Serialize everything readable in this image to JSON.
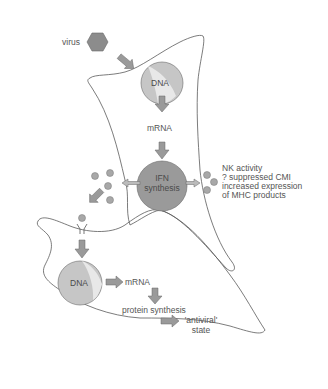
{
  "diagram": {
    "colors": {
      "cell_outline": "#5a5a5a",
      "virus_fill": "#8c8c8c",
      "dna_fill": "#c6c6c6",
      "dna_highlight": "#e6e6e6",
      "ifn_fill": "#9a9a9a",
      "arrow_fill": "#9a9a9a",
      "dot_fill": "#a8a8a8",
      "text": "#555555"
    },
    "labels": {
      "virus": "virus",
      "dna_upper": "DNA",
      "mrna_upper": "mRNA",
      "ifn_line1": "IFN",
      "ifn_line2": "synthesis",
      "effects": "NK activity\n? suppressed CMI\nincreased expression\nof MHC products",
      "dna_lower": "DNA",
      "mrna_lower": "mRNA",
      "protein_synthesis": "protein synthesis",
      "antiviral_state": "'antiviral'\nstate"
    },
    "nodes": [
      {
        "id": "virus",
        "shape": "hexagon",
        "label": "virus"
      },
      {
        "id": "infected-cell",
        "shape": "cell",
        "contains": [
          "DNA",
          "mRNA",
          "IFN synthesis"
        ]
      },
      {
        "id": "ifn-molecules",
        "shape": "dots",
        "count": 7
      },
      {
        "id": "receptor",
        "shape": "receptor"
      },
      {
        "id": "target-cell",
        "shape": "cell",
        "contains": [
          "DNA",
          "mRNA",
          "protein synthesis",
          "'antiviral' state"
        ]
      }
    ],
    "edges": [
      {
        "from": "virus",
        "to": "infected-cell"
      },
      {
        "from": "DNA",
        "to": "mRNA"
      },
      {
        "from": "mRNA",
        "to": "IFN synthesis"
      },
      {
        "from": "IFN synthesis",
        "to": "ifn-molecules-left"
      },
      {
        "from": "IFN synthesis",
        "to": "ifn-molecules-right"
      },
      {
        "from": "ifn-molecules-left",
        "to": "receptor"
      },
      {
        "from": "receptor",
        "to": "DNA (target)"
      },
      {
        "from": "DNA (target)",
        "to": "mRNA (target)"
      },
      {
        "from": "mRNA (target)",
        "to": "protein synthesis"
      },
      {
        "from": "protein synthesis",
        "to": "'antiviral' state"
      }
    ]
  }
}
